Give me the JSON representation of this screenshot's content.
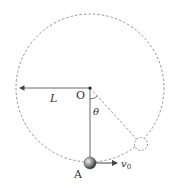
{
  "diagram": {
    "labels": {
      "pivot": "O",
      "length": "L",
      "angle": "θ",
      "ball": "A",
      "velocity": "v",
      "velocity_sub": "0"
    },
    "colors": {
      "line": "#555555",
      "dashed": "#888888",
      "ball": "#666666"
    }
  }
}
